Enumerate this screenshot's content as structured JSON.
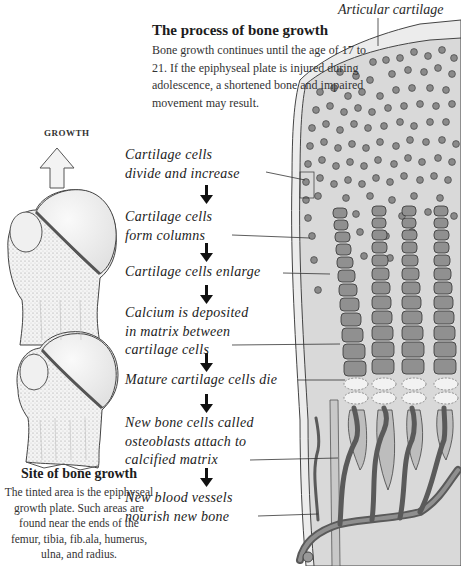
{
  "header": {
    "title": "The process of bone growth",
    "intro": "Bone growth continues until the age of 17 to 21. If the epiphyseal plate is injured during adolescence, a shortened bone and impaired movement may result."
  },
  "labels": {
    "articular_cartilage": "Articular cartilage",
    "growth": "GROWTH"
  },
  "steps": [
    {
      "text": "Cartilage cells divide and increase",
      "lines": [
        "Cartilage cells",
        "divide and increase"
      ]
    },
    {
      "text": "Cartilage cells form columns",
      "lines": [
        "Cartilage cells",
        "form columns"
      ]
    },
    {
      "text": "Cartilage cells enlarge",
      "lines": [
        "Cartilage cells enlarge"
      ]
    },
    {
      "text": "Calcium is deposited in matrix between cartilage cells",
      "lines": [
        "Calcium is deposited",
        "in matrix between",
        "cartilage cells"
      ]
    },
    {
      "text": "Mature cartilage cells die",
      "lines": [
        "Mature cartilage cells die"
      ]
    },
    {
      "text": "New bone cells called osteoblasts attach to calcified matrix",
      "lines": [
        "New bone cells called",
        "osteoblasts attach to",
        "calcified matrix"
      ]
    },
    {
      "text": "New blood vessels nourish new bone",
      "lines": [
        "New blood vessels",
        "nourish new bone"
      ]
    }
  ],
  "site": {
    "title": "Site of bone growth",
    "text": "The tinted area is the epiphyseal growth plate. Such areas are found near the ends of the femur, tibia, fib.ala, humerus, ulna, and radius."
  },
  "colors": {
    "cartilage_matrix": "#d9d9d9",
    "cell_fill": "#8a8a8a",
    "column_cell": "#909090",
    "vessel": "#5a5a5a",
    "bone": "#f2f2f2"
  }
}
